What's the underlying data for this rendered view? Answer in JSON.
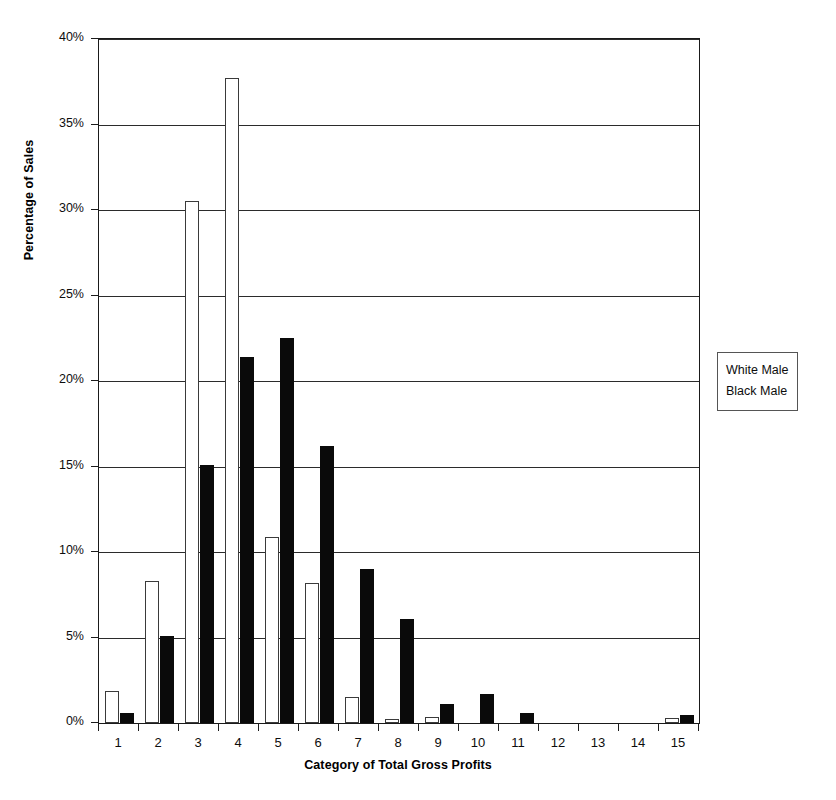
{
  "chart_data": {
    "type": "bar",
    "title": "",
    "xlabel": "Category of Total Gross Profits",
    "ylabel": "Percentage of Sales",
    "categories": [
      "1",
      "2",
      "3",
      "4",
      "5",
      "6",
      "7",
      "8",
      "9",
      "10",
      "11",
      "12",
      "13",
      "14",
      "15"
    ],
    "series": [
      {
        "name": "White Male",
        "color": "#ffffff",
        "values": [
          1.9,
          8.3,
          30.5,
          37.7,
          10.9,
          8.2,
          1.5,
          0.25,
          0.35,
          0.0,
          0.0,
          0.0,
          0.0,
          0.0,
          0.3
        ]
      },
      {
        "name": "Black Male",
        "color": "#0a0a0a",
        "values": [
          0.6,
          5.1,
          15.1,
          21.4,
          22.5,
          16.2,
          9.0,
          6.1,
          1.1,
          1.7,
          0.6,
          0.0,
          0.0,
          0.0,
          0.45
        ]
      }
    ],
    "ylim": [
      0,
      40
    ],
    "yticks": [
      0,
      5,
      10,
      15,
      20,
      25,
      30,
      35,
      40
    ],
    "ytick_labels": [
      "0%",
      "5%",
      "10%",
      "15%",
      "20%",
      "25%",
      "30%",
      "35%",
      "40%"
    ],
    "grid": true,
    "legend_position": "right",
    "legend_entries": [
      "White Male",
      "Black Male"
    ]
  },
  "legend": {
    "items": [
      {
        "label": "White Male"
      },
      {
        "label": "Black Male"
      }
    ]
  },
  "axes": {
    "y_title": "Percentage of Sales",
    "x_title": "Category of Total Gross Profits"
  }
}
